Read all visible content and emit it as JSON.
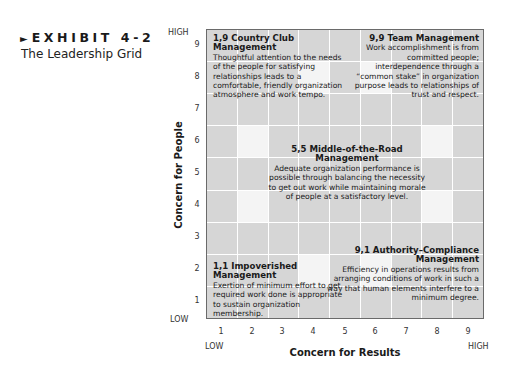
{
  "header": {
    "arrow": "►",
    "exhibit": "EXHIBIT 4-2",
    "title": "The Leadership Grid"
  },
  "axes": {
    "y": {
      "label": "Concern for People",
      "high": "HIGH",
      "low": "LOW",
      "ticks": [
        "9",
        "8",
        "7",
        "6",
        "5",
        "4",
        "3",
        "2",
        "1"
      ]
    },
    "x": {
      "label": "Concern for Results",
      "high": "HIGH",
      "low": "LOW",
      "ticks": [
        "1",
        "2",
        "3",
        "4",
        "5",
        "6",
        "7",
        "8",
        "9"
      ]
    }
  },
  "styles": {
    "1_9": {
      "title": "1,9 Country Club Management",
      "text": "Thoughtful attention to the needs of the people for satisfying relationships leads to a comfortable, friendly organization atmosphere and work tempo."
    },
    "9_9": {
      "title": "9,9 Team Management",
      "text": "Work accomplishment is from committed people; interdependence through a “common stake” in organization purpose leads to relationships of trust and respect."
    },
    "5_5": {
      "title": "5,5 Middle-of-the-Road Management",
      "text": "Adequate organization performance is possible through balancing the necessity to get out work while maintaining morale of people at a satisfactory level."
    },
    "1_1": {
      "title": "1,1 Impoverished Management",
      "text": "Exertion of minimum effort to get required work done is appropriate to sustain organization membership."
    },
    "9_1": {
      "title": "9,1 Authority–Compliance Management",
      "text": "Efficiency in operations results from arranging conditions of work in such a way that human elements interfere to a minimum degree."
    }
  },
  "colors": {
    "cell_gray": "#d6d6d6",
    "cell_light": "#f4f4f4",
    "border": "#6a6a6a"
  }
}
